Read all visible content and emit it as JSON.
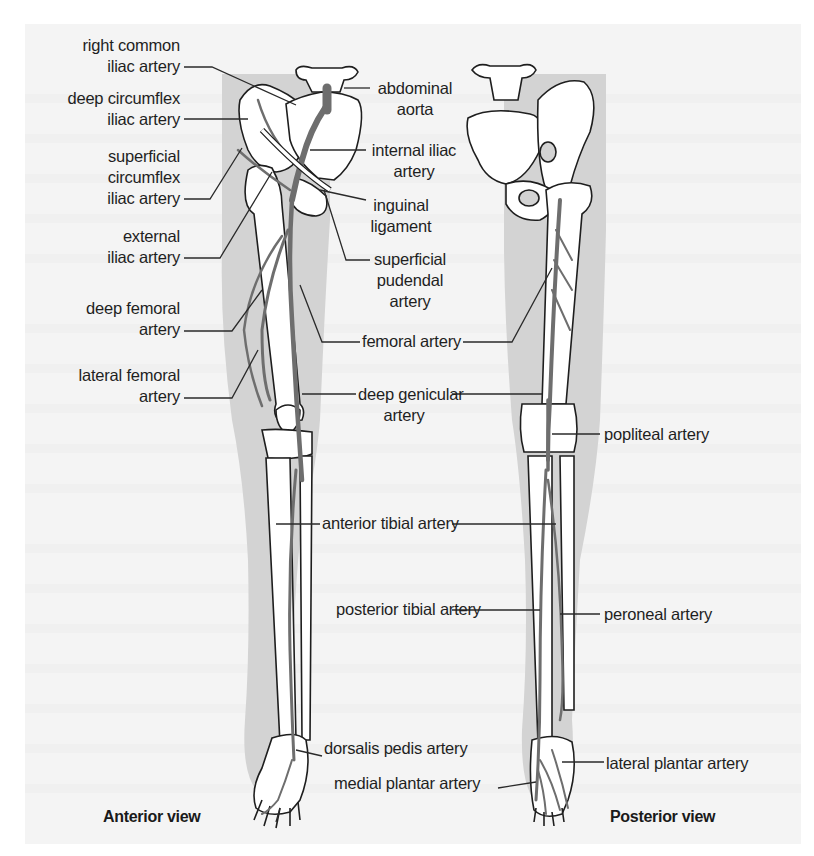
{
  "figure": {
    "views": [
      {
        "id": "anterior",
        "caption": "Anterior view"
      },
      {
        "id": "posterior",
        "caption": "Posterior view"
      }
    ],
    "colors": {
      "artery": "#6e6e6e",
      "limb_shadow": "#d3d3d3",
      "bone_fill": "#ffffff",
      "outline": "#1e1e1e",
      "page_bg": "#f4f4f4"
    }
  },
  "labels": {
    "right_common_iliac": {
      "line1": "right common",
      "line2": "iliac artery"
    },
    "deep_circumflex_iliac": {
      "line1": "deep circumflex",
      "line2": "iliac artery"
    },
    "superficial_circumflex_iliac": {
      "line1": "superficial",
      "line2": "circumflex",
      "line3": "iliac artery"
    },
    "external_iliac": {
      "line1": "external",
      "line2": "iliac artery"
    },
    "deep_femoral": {
      "line1": "deep femoral",
      "line2": "artery"
    },
    "lateral_femoral": {
      "line1": "lateral femoral",
      "line2": "artery"
    },
    "abdominal_aorta": {
      "line1": "abdominal",
      "line2": "aorta"
    },
    "internal_iliac": {
      "line1": "internal iliac",
      "line2": "artery"
    },
    "inguinal_ligament": {
      "line1": "inguinal",
      "line2": "ligament"
    },
    "superficial_pudendal": {
      "line1": "superficial",
      "line2": "pudendal",
      "line3": "artery"
    },
    "femoral": {
      "line1": "femoral artery"
    },
    "deep_genicular": {
      "line1": "deep genicular",
      "line2": "artery"
    },
    "anterior_tibial": {
      "line1": "anterior tibial artery"
    },
    "posterior_tibial": {
      "line1": "posterior tibial artery"
    },
    "dorsalis_pedis": {
      "line1": "dorsalis pedis artery"
    },
    "medial_plantar": {
      "line1": "medial plantar artery"
    },
    "popliteal": {
      "line1": "popliteal artery"
    },
    "peroneal": {
      "line1": "peroneal artery"
    },
    "lateral_plantar": {
      "line1": "lateral plantar artery"
    }
  }
}
